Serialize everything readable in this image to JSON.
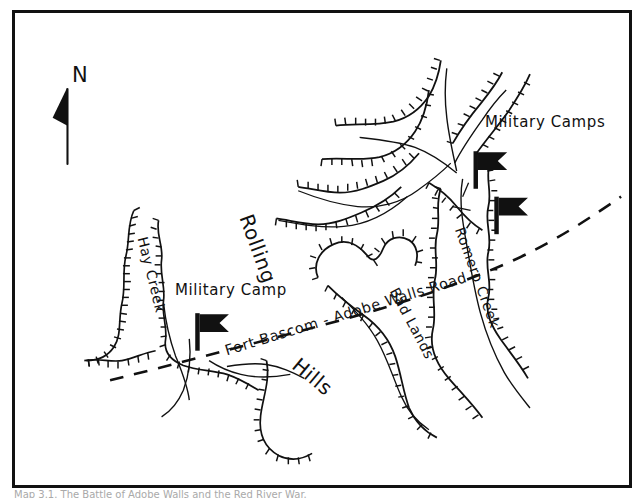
{
  "figure": {
    "kind": "historical-hand-drawn-map",
    "background_color": "#ffffff",
    "ink_color": "#111111",
    "frame_color": "#111111",
    "caption_text": "Map 3.1. The Battle of Adobe Walls and the Red River War."
  },
  "compass": {
    "letter": "N",
    "name": "north-arrow"
  },
  "labels": {
    "military_camps": "Military Camps",
    "military_camp": "Military Camp",
    "rolling": "Rolling",
    "hills": "Hills",
    "road": "Fort Bascom - Adobe Walls Road",
    "hay_creek": "Hay Creek",
    "romero_creek": "Romero Creek",
    "bad_lands": "Bad Lands"
  },
  "symbols": {
    "flag_left": "military-camp-flag",
    "flag_upper_right": "military-camp-flag",
    "flag_lower_right": "military-camp-flag"
  },
  "map_data": {
    "type": "hand-drawn pen-and-ink locality map",
    "features": [
      {
        "name": "Hay Creek",
        "kind": "creek",
        "side": "west"
      },
      {
        "name": "Romero Creek",
        "kind": "creek",
        "side": "east"
      },
      {
        "name": "Bad Lands",
        "kind": "terrain-region",
        "side": "center-east"
      },
      {
        "name": "Rolling Hills",
        "kind": "terrain-region",
        "side": "center-west"
      },
      {
        "name": "Fort Bascom - Adobe Walls Road",
        "kind": "road",
        "style": "dashed"
      },
      {
        "name": "Military Camp",
        "kind": "camp",
        "count": 1,
        "side": "west"
      },
      {
        "name": "Military Camps",
        "kind": "camp",
        "count": 2,
        "side": "east"
      }
    ],
    "styling": {
      "bluffs": "hachured escarpment lines",
      "road_style": "dashed",
      "drainage": "dendritic arroyo network"
    }
  }
}
